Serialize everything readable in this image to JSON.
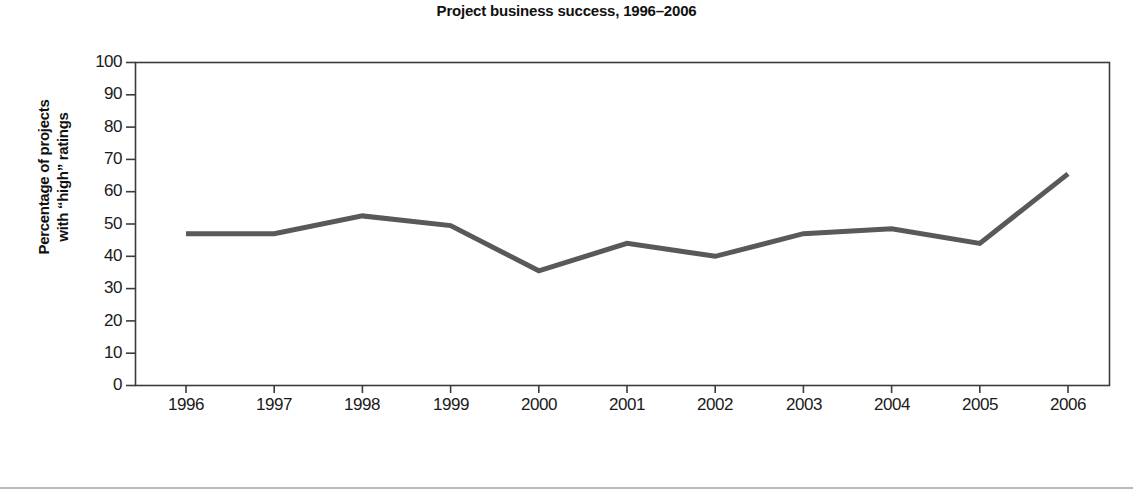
{
  "chart_data": {
    "type": "line",
    "title": "Project business success, 1996–2006",
    "xlabel": "Year of evaluation",
    "ylabel": "Percentage of projects with “high” ratings",
    "ylabel_line1": "Percentage of projects",
    "ylabel_line2": "with “high” ratings",
    "categories": [
      "1996",
      "1997",
      "1998",
      "1999",
      "2000",
      "2001",
      "2002",
      "2003",
      "2004",
      "2005",
      "2006"
    ],
    "values": [
      47,
      47,
      52.5,
      49.5,
      35.5,
      44,
      40,
      47,
      48.5,
      44,
      65.5
    ],
    "series": [
      {
        "name": "Percentage of projects with “high” ratings",
        "values": [
          47,
          47,
          52.5,
          49.5,
          35.5,
          44,
          40,
          47,
          48.5,
          44,
          65.5
        ],
        "color": "#595959"
      }
    ],
    "ylim": [
      0,
      100
    ],
    "ytick_labels": [
      "100",
      "90",
      "80",
      "70",
      "60",
      "50",
      "40",
      "30",
      "20",
      "10",
      "0"
    ],
    "ytick_values": [
      100,
      90,
      80,
      70,
      60,
      50,
      40,
      30,
      20,
      10,
      0
    ],
    "xtick_labels": [
      "1996",
      "1997",
      "1998",
      "1999",
      "2000",
      "2001",
      "2002",
      "2003",
      "2004",
      "2005",
      "2006"
    ],
    "grid": false,
    "legend": false,
    "legend_position": "none",
    "line_color": "#595959",
    "axis_color": "#3c3c3c",
    "background_color": "#ffffff"
  }
}
